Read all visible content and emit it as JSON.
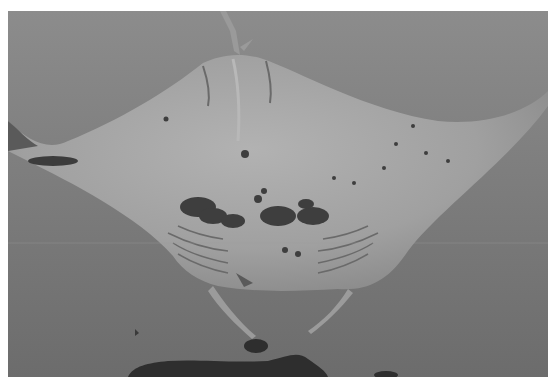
{
  "image": {
    "subject": "manta ray viewed from below",
    "style": "grayscale underwater photograph",
    "colors": {
      "border": "#ffffff",
      "water_top": "#8a8a8a",
      "water_bottom": "#6e6e6e",
      "ray_body": "#a3a3a3",
      "spots": "#3a3a3a",
      "reef": "#2e2e2e"
    }
  }
}
